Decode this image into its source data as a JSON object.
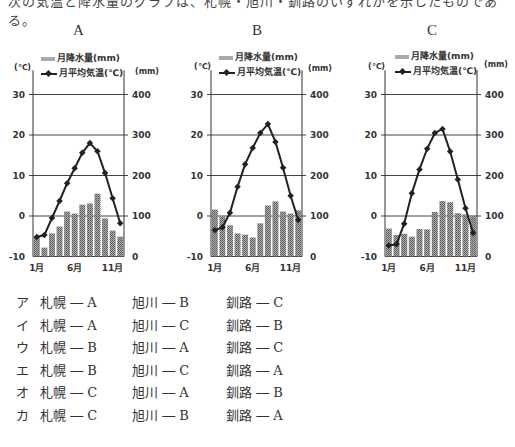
{
  "header": {
    "cut_text": "次の気温と降水量のグラフは、札幌・旭川・釧路のいずれかを示したものである。"
  },
  "legend": {
    "precip_label": "月降水量(mm)",
    "temp_label": "月平均気温(℃)",
    "left_unit": "(℃)",
    "right_unit": "(mm)"
  },
  "colors": {
    "bar": "#8c8c8c",
    "line": "#222222",
    "grid": "#444444"
  },
  "chart_data": [
    {
      "type": "bar+line",
      "title": "A",
      "categories": [
        "1月",
        "2月",
        "3月",
        "4月",
        "5月",
        "6月",
        "7月",
        "8月",
        "9月",
        "10月",
        "11月",
        "12月"
      ],
      "xtick_labels": [
        "1月",
        "6月",
        "11月"
      ],
      "y_left": {
        "label": "(℃)",
        "ticks": [
          -10,
          0,
          10,
          20,
          30
        ],
        "range": [
          -10,
          35
        ]
      },
      "y_right": {
        "label": "(mm)",
        "ticks": [
          0,
          100,
          200,
          300,
          400
        ],
        "range": [
          0,
          450
        ]
      },
      "series": [
        {
          "name": "月降水量(mm)",
          "type": "bar",
          "axis": "right",
          "values": [
            47,
            22,
            57,
            74,
            111,
            106,
            128,
            131,
            155,
            94,
            64,
            49
          ]
        },
        {
          "name": "月平均気温(℃)",
          "type": "line",
          "axis": "left",
          "values": [
            -5.2,
            -4.7,
            -0.5,
            3.7,
            8.1,
            11.8,
            15.6,
            18.0,
            16.0,
            10.6,
            4.4,
            -1.8
          ]
        }
      ]
    },
    {
      "type": "bar+line",
      "title": "B",
      "categories": [
        "1月",
        "2月",
        "3月",
        "4月",
        "5月",
        "6月",
        "7月",
        "8月",
        "9月",
        "10月",
        "11月",
        "12月"
      ],
      "xtick_labels": [
        "1月",
        "6月",
        "11月"
      ],
      "y_left": {
        "label": "(℃)",
        "ticks": [
          -10,
          0,
          10,
          20,
          30
        ],
        "range": [
          -10,
          35
        ]
      },
      "y_right": {
        "label": "(mm)",
        "ticks": [
          0,
          100,
          200,
          300,
          400
        ],
        "range": [
          0,
          450
        ]
      },
      "series": [
        {
          "name": "月降水量(mm)",
          "type": "bar",
          "axis": "right",
          "values": [
            116,
            99,
            77,
            57,
            54,
            47,
            82,
            126,
            136,
            111,
            106,
            114
          ]
        },
        {
          "name": "月平均気温(℃)",
          "type": "line",
          "axis": "left",
          "values": [
            -3.5,
            -2.8,
            0.8,
            7.2,
            12.8,
            16.8,
            20.5,
            22.7,
            18.3,
            11.9,
            5.0,
            -1.0
          ]
        }
      ]
    },
    {
      "type": "bar+line",
      "title": "C",
      "categories": [
        "1月",
        "2月",
        "3月",
        "4月",
        "5月",
        "6月",
        "7月",
        "8月",
        "9月",
        "10月",
        "11月",
        "12月"
      ],
      "xtick_labels": [
        "1月",
        "6月",
        "11月"
      ],
      "y_left": {
        "label": "(℃)",
        "ticks": [
          -10,
          0,
          10,
          20,
          30
        ],
        "range": [
          -10,
          35
        ]
      },
      "y_right": {
        "label": "(mm)",
        "ticks": [
          0,
          100,
          200,
          300,
          400
        ],
        "range": [
          0,
          450
        ]
      },
      "series": [
        {
          "name": "月降水量(mm)",
          "type": "bar",
          "axis": "right",
          "values": [
            69,
            53,
            56,
            49,
            68,
            67,
            110,
            137,
            134,
            107,
            104,
            101
          ]
        },
        {
          "name": "月平均気温(℃)",
          "type": "line",
          "axis": "left",
          "values": [
            -7.3,
            -7.0,
            -1.9,
            5.6,
            11.5,
            16.6,
            20.5,
            21.5,
            15.9,
            9.0,
            1.9,
            -4.2
          ]
        }
      ]
    }
  ],
  "options": [
    {
      "label": "ア",
      "sapporo": "札幌 ― A",
      "asahikawa": "旭川 ― B",
      "kushiro": "釧路 ― C"
    },
    {
      "label": "イ",
      "sapporo": "札幌 ― A",
      "asahikawa": "旭川 ― C",
      "kushiro": "釧路 ― B"
    },
    {
      "label": "ウ",
      "sapporo": "札幌 ― B",
      "asahikawa": "旭川 ― A",
      "kushiro": "釧路 ― C"
    },
    {
      "label": "エ",
      "sapporo": "札幌 ― B",
      "asahikawa": "旭川 ― C",
      "kushiro": "釧路 ― A"
    },
    {
      "label": "オ",
      "sapporo": "札幌 ― C",
      "asahikawa": "旭川 ― A",
      "kushiro": "釧路 ― B"
    },
    {
      "label": "カ",
      "sapporo": "札幌 ― C",
      "asahikawa": "旭川 ― B",
      "kushiro": "釧路 ― A"
    }
  ]
}
